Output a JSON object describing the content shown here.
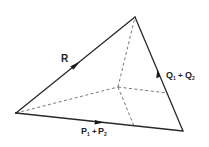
{
  "diagram": {
    "type": "force-triangle",
    "vertices": {
      "A": [
        16,
        113
      ],
      "B": [
        135,
        17
      ],
      "C": [
        183,
        131
      ],
      "O": [
        118,
        87
      ]
    },
    "edges": [
      {
        "from": "A",
        "to": "B",
        "style": "solid",
        "label": "R",
        "arrow": "toward B"
      },
      {
        "from": "C",
        "to": "B",
        "style": "solid",
        "label": "Q₁ + Q₂",
        "arrow": "toward B"
      },
      {
        "from": "A",
        "to": "C",
        "style": "solid",
        "label": "P₁ + P₂",
        "arrow": "toward C"
      },
      {
        "from": "A",
        "to": "O",
        "style": "dashed"
      },
      {
        "from": "O",
        "to": "B",
        "style": "dashed"
      },
      {
        "from": "O",
        "to": "AC-point",
        "style": "dashed"
      },
      {
        "from": "O",
        "to": "BC-point",
        "style": "dashed"
      }
    ],
    "labels": {
      "r": "R",
      "q_main": "Q",
      "q_sub1": "1",
      "q_plus": "+",
      "q2_main": "Q",
      "q_sub2": "2",
      "p_main": "P",
      "p_sub1": "1",
      "p_plus": "+",
      "p2_main": "P",
      "p_sub2": "2"
    },
    "colors": {
      "line": "#2a2a2a",
      "dashed": "#555555",
      "background": "#ffffff"
    }
  }
}
